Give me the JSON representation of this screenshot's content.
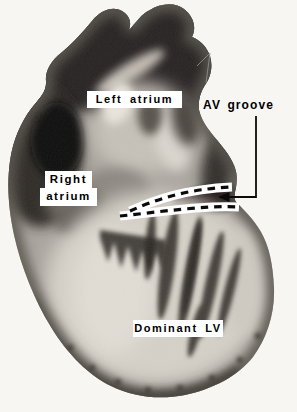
{
  "figure": {
    "background_color": "#f7f6f3",
    "annotations": {
      "left_atrium": "Left atrium",
      "av_groove": "AV groove",
      "right_atrium_line1": "Right",
      "right_atrium_line2": "atrium",
      "dominant_lv": "Dominant LV"
    },
    "markers": {
      "dashed_band": "white band with black dashes outlining the atrioventricular groove",
      "arrow": "black arrow pointing left from AV groove leader line into the groove"
    },
    "colors": {
      "label_background": "#ffffff",
      "label_text": "#000000",
      "annotation_line": "#000000",
      "photo_dark": "#25221e",
      "photo_mid": "#a8a49d",
      "photo_light": "#d8d4cb"
    }
  }
}
